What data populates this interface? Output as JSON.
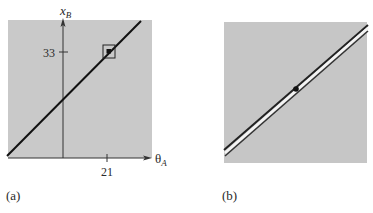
{
  "panel_a": {
    "label": "(a)",
    "y_axis_label": "x",
    "y_axis_sub": "B",
    "x_axis_label": "θ",
    "x_axis_sub": "A",
    "y_tick": "33",
    "x_tick": "21"
  },
  "panel_b": {
    "label": "(b)"
  },
  "colors": {
    "background": "#c8c8c8",
    "line": "#111111",
    "highlight": "#f4f4f4"
  }
}
